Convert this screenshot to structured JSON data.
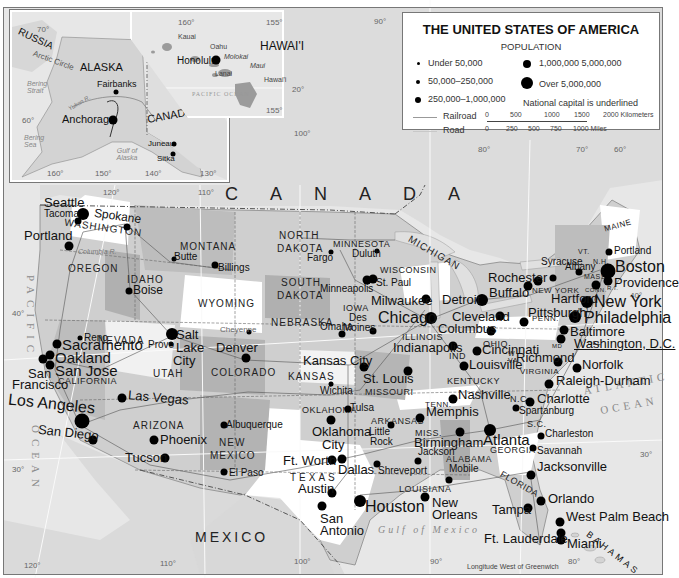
{
  "legend": {
    "title": "THE UNITED STATES OF AMERICA",
    "subtitle": "POPULATION",
    "sizes": [
      {
        "label": "Under 50,000",
        "size": 3
      },
      {
        "label": "50,000–250,000",
        "size": 4
      },
      {
        "label": "250,000–1,000,000",
        "size": 6
      },
      {
        "label": "1,000,000  5,000,000",
        "size": 8
      },
      {
        "label": "Over 5,000,000",
        "size": 12
      }
    ],
    "capital_note": "National capital is underlined",
    "railroad": "Railroad",
    "road": "Road",
    "scale_km": [
      "0",
      "500",
      "1000",
      "1500",
      "2000 Kilometers"
    ],
    "scale_mi": [
      "0",
      "250",
      "500",
      "750",
      "1000 Miles"
    ]
  },
  "alaska_inset": {
    "labels": {
      "russia": "RUSSIA",
      "arctic_circle": "Arctic Circle",
      "alaska": "ALASKA",
      "bering_strait": "Bering Strait",
      "bering_sea": "Bering Sea",
      "canada": "CANADA",
      "gulf": "Gulf of Alaska",
      "yukon": "Yukon R."
    },
    "cities": [
      "Fairbanks",
      "Anchorage",
      "Juneau",
      "Sitka"
    ],
    "degrees": [
      "70°",
      "60°",
      "160°",
      "150°",
      "140°",
      "130°"
    ]
  },
  "hawaii_inset": {
    "title": "HAWAI'I",
    "islands": [
      "Kauai",
      "Oahu",
      "Molokai",
      "Maui",
      "Lanai",
      "Hawai'i"
    ],
    "city": "Honolulu",
    "ocean": "PACIFIC OCEAN",
    "degrees": [
      "160°",
      "155°",
      "155°",
      "20°"
    ]
  },
  "countries": {
    "canada": "CANADA",
    "mexico": "MEXICO",
    "bahamas": "BAHAMAS"
  },
  "water": {
    "pacific": "PACIFIC",
    "ocean_west": "OCEAN",
    "atlantic": "ATLANTIC",
    "ocean_east": "OCEAN",
    "gulf": "Gulf of Mexico"
  },
  "states": {
    "washington": "WASHINGTON",
    "oregon": "OREGON",
    "idaho": "IDAHO",
    "montana": "MONTANA",
    "wyoming": "WYOMING",
    "nevada": "NEVADA",
    "california": "CALIFORNIA",
    "utah": "UTAH",
    "colorado": "COLORADO",
    "arizona": "ARIZONA",
    "new_mexico_1": "NEW",
    "new_mexico_2": "MEXICO",
    "north_dakota_1": "NORTH",
    "north_dakota_2": "DAKOTA",
    "south_dakota_1": "SOUTH",
    "south_dakota_2": "DAKOTA",
    "nebraska": "NEBRASKA",
    "kansas": "KANSAS",
    "oklahoma": "OKLAHOMA",
    "texas": "TEXAS",
    "minnesota": "MINNESOTA",
    "iowa": "IOWA",
    "missouri": "MISSOURI",
    "arkansas": "ARKANSAS",
    "louisiana": "LOUISIANA",
    "wisconsin": "WISCONSIN",
    "illinois": "ILLINOIS",
    "michigan": "MICHIGAN",
    "indiana": "IND",
    "ohio": "OHIO",
    "kentucky": "KENTUCKY",
    "tennessee": "TENN.",
    "mississippi": "MISS.",
    "alabama": "ALABAMA",
    "georgia": "GEORGIA",
    "florida": "FLORIDA",
    "south_carolina": "S.C.",
    "north_carolina": "N.C.",
    "virginia": "VIRGINIA",
    "west_virginia": "W VA",
    "pennsylvania": "PENN.",
    "new_york": "NEW YORK",
    "vermont": "VT.",
    "new_hampshire": "N.H.",
    "maine": "MAINE",
    "massachusetts": "MASS.",
    "connecticut": "CONN.",
    "rhode_island": "R.I.",
    "new_jersey": "N.J.",
    "delaware": "DEL",
    "maryland": "MD"
  },
  "cities": {
    "seattle": "Seattle",
    "tacoma": "Tacoma",
    "spokane": "Spokane",
    "portland_or": "Portland",
    "boise": "Boise",
    "butte": "Butte",
    "billings": "Billings",
    "cheyenne": "Cheyenne",
    "sacramento": "Sacramento",
    "oakland": "Oakland",
    "san_francisco_1": "San",
    "san_francisco_2": "Francisco",
    "san_jose": "San Jose",
    "reno": "Reno",
    "los_angeles": "Los Angeles",
    "san_diego": "San Diego",
    "las_vegas": "Las Vegas",
    "salt_lake_1": "Salt",
    "salt_lake_2": "Lake",
    "salt_lake_3": "City",
    "provo": "Provo",
    "denver": "Denver",
    "phoenix": "Phoenix",
    "tucson": "Tucson",
    "albuquerque": "Albuquerque",
    "el_paso": "El Paso",
    "fargo": "Fargo",
    "duluth": "Duluth",
    "minneapolis": "Minneapolis",
    "st_paul": "St. Paul",
    "omaha": "Omaha",
    "des_moines_1": "Des",
    "des_moines_2": "Moines",
    "kansas_city": "Kansas City",
    "wichita": "Wichita",
    "tulsa": "Tulsa",
    "oklahoma_city_1": "Oklahoma",
    "oklahoma_city_2": "City",
    "ft_worth": "Ft. Worth",
    "dallas": "Dallas",
    "austin": "Austin",
    "san_antonio_1": "San",
    "san_antonio_2": "Antonio",
    "houston": "Houston",
    "shreveport": "Shreveport",
    "little_rock_1": "Little",
    "little_rock_2": "Rock",
    "st_louis": "St. Louis",
    "milwaukee": "Milwaukee",
    "chicago": "Chicago",
    "indianapolis": "Indianapolis",
    "detroit": "Detroit",
    "cleveland": "Cleveland",
    "columbus": "Columbus",
    "cincinnati": "Cincinnati",
    "louisville": "Louisville",
    "nashville": "Nashville",
    "memphis": "Memphis",
    "jackson": "Jackson",
    "birmingham": "Birmingham",
    "mobile": "Mobile",
    "new_orleans_1": "New",
    "new_orleans_2": "Orleans",
    "atlanta": "Atlanta",
    "charlotte": "Charlotte",
    "spartanburg": "Spartanburg",
    "charleston": "Charleston",
    "savannah": "Savannah",
    "jacksonville": "Jacksonville",
    "orlando": "Orlando",
    "tampa": "Tampa",
    "west_palm_beach": "West Palm Beach",
    "ft_lauderdale": "Ft. Lauderdale",
    "miami": "Miami",
    "raleigh_durham": "Raleigh-Durham",
    "norfolk": "Norfolk",
    "richmond": "Richmond",
    "washington_dc": "Washington, D.C.",
    "baltimore": "Baltimore",
    "philadelphia": "Philadelphia",
    "new_york": "New York",
    "hartford": "Hartford",
    "providence": "Providence",
    "boston": "Boston",
    "portland_me": "Portland",
    "albany": "Albany",
    "syracuse": "Syracuse",
    "rochester": "Rochester",
    "buffalo": "Buffalo",
    "pittsburgh": "Pittsburgh"
  },
  "degrees": {
    "d90_top": "90°",
    "d120_top": "120°",
    "d110_top": "110°",
    "d100_top": "100°",
    "d80_top": "80°",
    "d70_top": "70°",
    "d60_top": "60°",
    "d40_west": "40°",
    "d30_west": "30°",
    "d40_east": "40°",
    "d30_east": "30°",
    "d120_bot": "120°",
    "d110_bot": "110°",
    "d100_bot": "100°",
    "d90_bot": "90°",
    "d80_bot": "80°"
  },
  "footer": {
    "longitude_note": "Longitude West of Greenwich"
  },
  "colors": {
    "water": "#e6e6e6",
    "state_light": "#ffffff",
    "state_mid": "#cfcfcf",
    "state_dark": "#a8a8a8",
    "dot": "#000000"
  }
}
